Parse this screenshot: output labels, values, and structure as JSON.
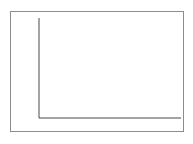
{
  "chart_data": {
    "type": "line",
    "title": "",
    "xlabel": "",
    "ylabel": "",
    "xlim": [
      14.6,
      25.6
    ],
    "ylim": [
      50.0,
      53.0
    ],
    "grid": false,
    "legend": null,
    "x_ticks": [
      16,
      18,
      20,
      22,
      24
    ],
    "x_tick_labels": [
      "16",
      "18",
      "20",
      "22",
      "24"
    ],
    "y_ticks": [
      50,
      50.5,
      51,
      51.5,
      52,
      52.5,
      53
    ],
    "y_tick_labels": [
      "50",
      "50.5",
      "51",
      "51.5",
      "52",
      "52.5",
      "53"
    ],
    "series": [
      {
        "name": "curve",
        "color": "#1a1a1a",
        "x": [
          15.2,
          15.5,
          16.0,
          16.5,
          17.0,
          17.5,
          18.0,
          18.5,
          19.0,
          19.5,
          20.0,
          20.2,
          20.5,
          21.0,
          21.5,
          22.0,
          22.5,
          23.0,
          23.5,
          24.0,
          24.5,
          25.0,
          25.2
        ],
        "y": [
          50.0,
          50.32,
          50.79,
          51.13,
          51.38,
          51.57,
          51.7,
          51.79,
          51.85,
          51.87,
          51.87,
          51.87,
          51.85,
          51.8,
          51.73,
          51.64,
          51.52,
          51.37,
          51.2,
          51.0,
          50.77,
          50.55,
          50.45
        ]
      }
    ],
    "axis_origin_value": {
      "x": 14.6,
      "y": 50.0
    }
  },
  "axes": {
    "y_axis_name": "y-axis",
    "x_axis_name": "x-axis"
  }
}
